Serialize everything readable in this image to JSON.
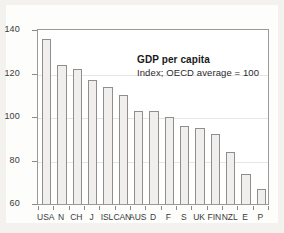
{
  "annotation": {
    "title": "GDP per capita",
    "subtitle": "Index; OECD average = 100"
  },
  "axis": {
    "y_ticks": [
      "140",
      "120",
      "100",
      "80",
      "60"
    ]
  },
  "chart_data": {
    "type": "bar",
    "title": "GDP per capita",
    "subtitle": "Index; OECD average = 100",
    "xlabel": "",
    "ylabel": "",
    "ylim": [
      60,
      140
    ],
    "yticks": [
      60,
      80,
      100,
      120,
      140
    ],
    "grid": true,
    "legend": "none",
    "categories": [
      "USA",
      "N",
      "CH",
      "J",
      "ISL",
      "CAN",
      "AUS",
      "D",
      "F",
      "S",
      "UK",
      "FIN",
      "NZL",
      "E",
      "P"
    ],
    "values": [
      136,
      124,
      122,
      117,
      114,
      110,
      103,
      103,
      100,
      96,
      95,
      92,
      84,
      74,
      67
    ],
    "colors": {
      "bar_fill": "#f0efed",
      "bar_edge": "#8e8e8e",
      "frame": "#9a9a9a",
      "grid": "#e6e6e6",
      "text": "#3a3a3a",
      "background": "#f3f2ef",
      "card": "#fdfdfc"
    }
  }
}
